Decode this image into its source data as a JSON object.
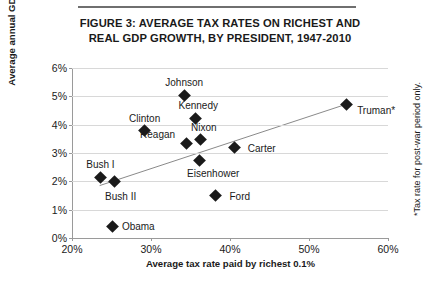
{
  "figure": {
    "title_line1": "FIGURE 3: AVERAGE TAX RATES ON RICHEST AND",
    "title_line2": "REAL GDP GROWTH, BY PRESIDENT, 1947-2010",
    "footnote": "*Tax rate for post-war period only."
  },
  "chart_data": {
    "type": "scatter",
    "title": "FIGURE 3: AVERAGE TAX RATES ON RICHEST AND REAL GDP GROWTH, BY PRESIDENT, 1947-2010",
    "xlabel": "Average tax rate paid by richest 0.1%",
    "ylabel": "Average annual GDP growth rate",
    "xlim": [
      20,
      60
    ],
    "ylim": [
      0,
      6
    ],
    "xticks": [
      "20%",
      "30%",
      "40%",
      "50%",
      "60%"
    ],
    "yticks": [
      "0%",
      "1%",
      "2%",
      "3%",
      "4%",
      "5%",
      "6%"
    ],
    "grid": true,
    "legend": "none",
    "marker_color": "#1a1a1a",
    "trendline": {
      "show": true,
      "x_start": 23.5,
      "y_start": 1.85,
      "x_end": 54.7,
      "y_end": 4.72,
      "color": "#8a8a8a"
    },
    "points": [
      {
        "label": "Truman*",
        "x": 54.7,
        "y": 4.72,
        "label_dx": 30,
        "label_dy": 6
      },
      {
        "label": "Johnson",
        "x": 34.2,
        "y": 5.02,
        "label_dx": 0,
        "label_dy": -14
      },
      {
        "label": "Kennedy",
        "x": 35.6,
        "y": 4.22,
        "label_dx": 3,
        "label_dy": -13
      },
      {
        "label": "Clinton",
        "x": 29.2,
        "y": 3.79,
        "label_dx": 0,
        "label_dy": -13
      },
      {
        "label": "Reagan",
        "x": 34.5,
        "y": 3.35,
        "label_dx": -29,
        "label_dy": -9
      },
      {
        "label": "Nixon",
        "x": 36.3,
        "y": 3.49,
        "label_dx": 3,
        "label_dy": -12
      },
      {
        "label": "Eisenhower",
        "x": 36.1,
        "y": 2.75,
        "label_dx": 14,
        "label_dy": 13
      },
      {
        "label": "Carter",
        "x": 40.6,
        "y": 3.19,
        "label_dx": 27,
        "label_dy": 0
      },
      {
        "label": "Bush I",
        "x": 23.6,
        "y": 2.13,
        "label_dx": 0,
        "label_dy": -14
      },
      {
        "label": "Bush II",
        "x": 25.4,
        "y": 1.98,
        "label_dx": 6,
        "label_dy": 14
      },
      {
        "label": "Ford",
        "x": 38.2,
        "y": 1.5,
        "label_dx": 24,
        "label_dy": 0
      },
      {
        "label": "Obama",
        "x": 25.1,
        "y": 0.42,
        "label_dx": 26,
        "label_dy": 0
      }
    ]
  }
}
